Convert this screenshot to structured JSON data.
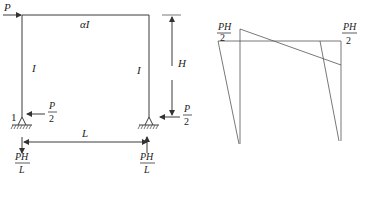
{
  "frame": {
    "load_label": "P",
    "beam_label": "αI",
    "left_column_label": "I",
    "right_column_label": "I",
    "height_label": "H",
    "span_label": "L",
    "node_label": "1",
    "left_reaction_horizontal": {
      "num": "P",
      "den": "2"
    },
    "right_reaction_horizontal": {
      "num": "P",
      "den": "2"
    },
    "left_reaction_vertical": {
      "num": "PH",
      "den": "L"
    },
    "right_reaction_vertical": {
      "num": "PH",
      "den": "L"
    }
  },
  "moment_diagram": {
    "left_value": {
      "num": "PH",
      "den": "2"
    },
    "right_value": {
      "num": "PH",
      "den": "2"
    }
  }
}
